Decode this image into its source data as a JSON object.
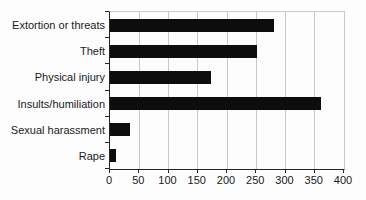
{
  "chart_data": {
    "type": "bar",
    "orientation": "horizontal",
    "title": "",
    "xlabel": "",
    "ylabel": "",
    "categories": [
      "Extortion or threats",
      "Theft",
      "Physical injury",
      "Insults/humiliation",
      "Sexual harassment",
      "Rape"
    ],
    "values": [
      280,
      252,
      172,
      360,
      35,
      10
    ],
    "xlim": [
      0,
      400
    ],
    "x_ticks": [
      0,
      50,
      100,
      150,
      200,
      250,
      300,
      350,
      400
    ],
    "grid": true,
    "legend": false,
    "colors": {
      "bar": "#0d0d0d",
      "gridline": "#c9c9c9",
      "axis": "#262626",
      "text": "#1a1a1a",
      "background": "#fdfdfd"
    }
  }
}
